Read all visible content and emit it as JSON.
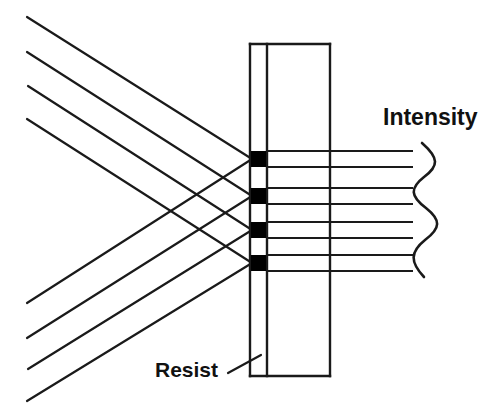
{
  "figure": {
    "kind": "optical-interference-lithography-diagram",
    "background_color": "#ffffff",
    "stroke_color": "#1a1a1a",
    "fill_color": "#000000",
    "width": 494,
    "height": 415
  },
  "labels": {
    "intensity": "Intensity",
    "resist": "Resist"
  },
  "label_positions": {
    "intensity": {
      "x": 383,
      "y": 125
    },
    "resist": {
      "x": 155,
      "y": 377
    }
  },
  "leader_line": {
    "name": "resist-leader-line",
    "x1": 228,
    "y1": 373,
    "x2": 261,
    "y2": 355
  },
  "resist_slab": {
    "top": 44,
    "bottom": 376,
    "left_edge_x": 250,
    "inner_edge_x": 267,
    "right_edge_x": 330,
    "stroke_width": 2.4
  },
  "exposure_sites": {
    "count": 4,
    "width": 15,
    "height": 16,
    "x": 251,
    "y_centers": [
      159,
      196,
      230,
      263
    ],
    "color": "#000000"
  },
  "beams": {
    "count_down": 4,
    "count_up": 4,
    "stroke_width": 2.2,
    "down": [
      {
        "x1": 27,
        "y1": 17,
        "x2": 252,
        "y2": 159
      },
      {
        "x1": 27,
        "y1": 52,
        "x2": 252,
        "y2": 196
      },
      {
        "x1": 28,
        "y1": 86,
        "x2": 252,
        "y2": 230
      },
      {
        "x1": 27,
        "y1": 119,
        "x2": 252,
        "y2": 263
      }
    ],
    "up": [
      {
        "x1": 27,
        "y1": 303,
        "x2": 252,
        "y2": 159
      },
      {
        "x1": 27,
        "y1": 338,
        "x2": 252,
        "y2": 196
      },
      {
        "x1": 28,
        "y1": 369,
        "x2": 252,
        "y2": 230
      },
      {
        "x1": 27,
        "y1": 401,
        "x2": 252,
        "y2": 263
      }
    ]
  },
  "intensity_lines": {
    "count": 8,
    "x_start": 267,
    "x_end": 413,
    "stroke_width": 2.2,
    "y_values": [
      151,
      167,
      188,
      204,
      222,
      238,
      255,
      271
    ]
  },
  "intensity_wave": {
    "name": "intensity-sinusoid",
    "stroke_width": 2.6,
    "x_center": 428,
    "amplitude": 10,
    "y_top": 143,
    "y_bottom": 277,
    "path": "M 422 143 C 439 158, 439 166, 424 177 C 410 188, 410 196, 426 208 C 441 220, 441 228, 425 240 C 410 252, 410 262, 424 277"
  },
  "chart_data": {
    "type": "line",
    "title": "Intensity",
    "xlabel": "",
    "ylabel": "Depth in resist",
    "legend": [],
    "grid": false,
    "series": [
      {
        "name": "Intensity profile",
        "orientation": "vertical",
        "depth": [
          151,
          167,
          188,
          204,
          222,
          238,
          255,
          271
        ],
        "values": [
          1,
          1,
          1,
          1,
          1,
          1,
          1,
          1
        ]
      }
    ],
    "annotations": [
      {
        "text": "Intensity",
        "x": 383,
        "y": 125
      },
      {
        "text": "Resist",
        "x": 155,
        "y": 377
      }
    ]
  }
}
